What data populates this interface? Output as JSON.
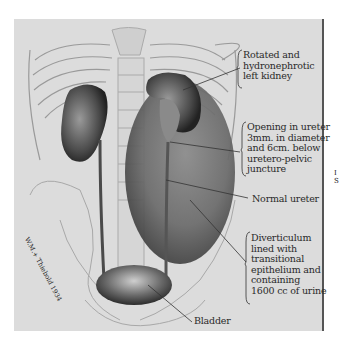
{
  "figure": {
    "type": "medical illustration",
    "background_color": "#dcdcdc",
    "labels": [
      {
        "id": "left-kidney",
        "lines": [
          "Rotated and",
          "hydronephrotic",
          "left kidney"
        ]
      },
      {
        "id": "ureter-opening",
        "lines": [
          "Opening in ureter",
          "3mm. in diameter",
          "and 6cm. below",
          "uretero-pelvic",
          "juncture"
        ]
      },
      {
        "id": "normal-ureter",
        "lines": [
          "Normal ureter"
        ]
      },
      {
        "id": "diverticulum",
        "lines": [
          "Diverticulum",
          "lined with",
          "transitional",
          "epithelium and",
          "containing",
          "1600 cc of urine"
        ]
      },
      {
        "id": "bladder",
        "lines": [
          "Bladder"
        ]
      }
    ],
    "signature": "W.M.+ Thiebold 1934",
    "margin_fragment": [
      "I",
      "S"
    ]
  }
}
